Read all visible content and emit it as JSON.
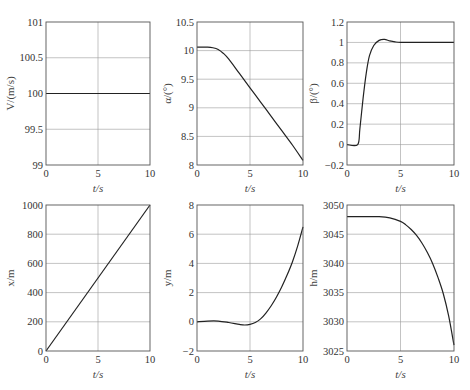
{
  "figure": {
    "layout": "2x3 subplots",
    "background": "#ffffff",
    "line_color": "#222222",
    "grid_color": "#9a9a9a"
  },
  "chart_data": [
    {
      "id": "V",
      "type": "line",
      "title": "",
      "xlabel": "t/s",
      "ylabel": "V/(m/s)",
      "xlim": [
        0,
        10
      ],
      "ylim": [
        99,
        101
      ],
      "xticks": [
        0,
        5,
        10
      ],
      "yticks": [
        99,
        99.5,
        100,
        100.5,
        101
      ],
      "xtick_labels": [
        "0",
        "5",
        "10"
      ],
      "ytick_labels": [
        "99",
        "99.5",
        "100",
        "100.5",
        "101"
      ],
      "grid": true,
      "x": [
        0,
        10
      ],
      "values": [
        100,
        100
      ]
    },
    {
      "id": "alpha",
      "type": "line",
      "title": "",
      "xlabel": "t/s",
      "ylabel": "α/(°)",
      "xlim": [
        0,
        10
      ],
      "ylim": [
        8,
        10.5
      ],
      "xticks": [
        0,
        5,
        10
      ],
      "yticks": [
        8,
        8.5,
        9,
        9.5,
        10,
        10.5
      ],
      "xtick_labels": [
        "0",
        "5",
        "10"
      ],
      "ytick_labels": [
        "8",
        "8.5",
        "9",
        "9.5",
        "10",
        "10.5"
      ],
      "grid": true,
      "x": [
        0,
        1,
        1.5,
        2,
        2.5,
        3,
        4,
        5,
        6,
        7,
        8,
        9,
        10
      ],
      "values": [
        10.06,
        10.06,
        10.05,
        10.02,
        9.95,
        9.85,
        9.6,
        9.35,
        9.1,
        8.85,
        8.6,
        8.35,
        8.08
      ]
    },
    {
      "id": "beta",
      "type": "line",
      "title": "",
      "xlabel": "t/s",
      "ylabel": "β/(°)",
      "xlim": [
        0,
        10
      ],
      "ylim": [
        -0.2,
        1.2
      ],
      "xticks": [
        0,
        5,
        10
      ],
      "yticks": [
        -0.2,
        0,
        0.2,
        0.4,
        0.6,
        0.8,
        1,
        1.2
      ],
      "xtick_labels": [
        "0",
        "5",
        "10"
      ],
      "ytick_labels": [
        "−0.2",
        "0",
        "0.2",
        "0.4",
        "0.6",
        "0.8",
        "1",
        "1.2"
      ],
      "grid": true,
      "x": [
        0,
        1,
        1.2,
        1.5,
        1.8,
        2.1,
        2.5,
        3,
        3.5,
        4,
        4.5,
        5,
        6,
        7,
        8,
        9,
        10
      ],
      "values": [
        0,
        0,
        0.15,
        0.45,
        0.7,
        0.87,
        0.97,
        1.02,
        1.03,
        1.015,
        1.005,
        1.0,
        1.0,
        1.0,
        1.0,
        1.0,
        1.0
      ]
    },
    {
      "id": "x",
      "type": "line",
      "title": "",
      "xlabel": "t/s",
      "ylabel": "x/m",
      "xlim": [
        0,
        10
      ],
      "ylim": [
        0,
        1000
      ],
      "xticks": [
        0,
        5,
        10
      ],
      "yticks": [
        0,
        200,
        400,
        600,
        800,
        1000
      ],
      "xtick_labels": [
        "0",
        "5",
        "10"
      ],
      "ytick_labels": [
        "0",
        "200",
        "400",
        "600",
        "800",
        "1000"
      ],
      "grid": true,
      "x": [
        0,
        10
      ],
      "values": [
        0,
        1000
      ]
    },
    {
      "id": "y",
      "type": "line",
      "title": "",
      "xlabel": "t/s",
      "ylabel": "y/m",
      "xlim": [
        0,
        10
      ],
      "ylim": [
        -2,
        8
      ],
      "xticks": [
        0,
        5,
        10
      ],
      "yticks": [
        -2,
        0,
        2,
        4,
        6,
        8
      ],
      "xtick_labels": [
        "0",
        "5",
        "10"
      ],
      "ytick_labels": [
        "−2",
        "0",
        "2",
        "4",
        "6",
        "8"
      ],
      "grid": true,
      "x": [
        0,
        1,
        2,
        3,
        4,
        4.5,
        5,
        5.5,
        6,
        6.5,
        7,
        7.5,
        8,
        8.5,
        9,
        9.5,
        10
      ],
      "values": [
        0,
        0.05,
        0.05,
        -0.05,
        -0.18,
        -0.22,
        -0.18,
        -0.05,
        0.2,
        0.6,
        1.1,
        1.7,
        2.4,
        3.2,
        4.1,
        5.2,
        6.5
      ]
    },
    {
      "id": "h",
      "type": "line",
      "title": "",
      "xlabel": "t/s",
      "ylabel": "h/m",
      "xlim": [
        0,
        10
      ],
      "ylim": [
        3025,
        3050
      ],
      "xticks": [
        0,
        5,
        10
      ],
      "yticks": [
        3025,
        3030,
        3035,
        3040,
        3045,
        3050
      ],
      "xtick_labels": [
        "0",
        "5",
        "10"
      ],
      "ytick_labels": [
        "3025",
        "3030",
        "3035",
        "3040",
        "3045",
        "3050"
      ],
      "grid": true,
      "x": [
        0,
        2,
        3,
        4,
        5,
        5.5,
        6,
        6.5,
        7,
        7.5,
        8,
        8.5,
        9,
        9.5,
        10
      ],
      "values": [
        3048,
        3048,
        3048,
        3047.8,
        3047.2,
        3046.6,
        3045.8,
        3044.8,
        3043.5,
        3041.9,
        3040,
        3037.6,
        3034.8,
        3031,
        3026
      ]
    }
  ]
}
